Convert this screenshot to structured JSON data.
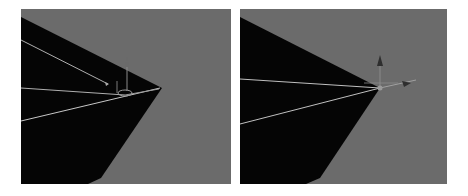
{
  "figure": {
    "panels": [
      {
        "name": "viewport-left",
        "description": "3D viewport showing dark mesh with pivot gizmo near vertex, before adjustment",
        "background_color": "#6b6b6b",
        "mesh_color": "#050505",
        "edge_color": "#b8b8b8"
      },
      {
        "name": "viewport-right",
        "description": "3D viewport showing dark mesh with transform gizmo snapped to vertex",
        "background_color": "#6b6b6b",
        "mesh_color": "#050505",
        "edge_color": "#b8b8b8"
      }
    ]
  }
}
